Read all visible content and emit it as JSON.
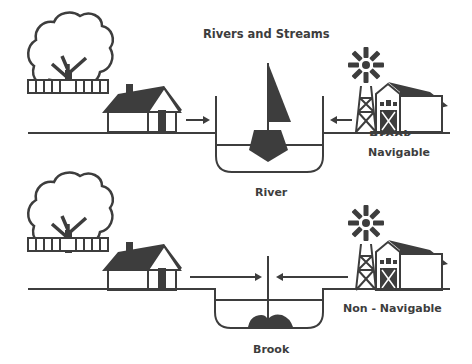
{
  "title": "Rivers and Streams",
  "top_panel": {
    "channel_label": "River",
    "classification": "Navigable",
    "overlap_text": "Brook"
  },
  "bottom_panel": {
    "channel_label": "Brook",
    "classification": "Non - Navigable"
  },
  "colors": {
    "ink": "#3d3d3d",
    "background": "#ffffff"
  },
  "icons": [
    "tree-icon",
    "fence-icon",
    "house-icon",
    "windmill-icon",
    "barn-icon",
    "sailboat-icon",
    "rocks-icon",
    "arrow-right-icon",
    "arrow-left-icon"
  ]
}
